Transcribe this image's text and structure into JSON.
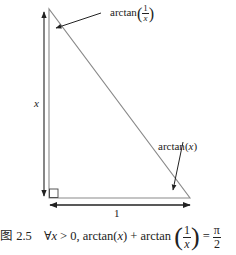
{
  "figure": {
    "type": "right-triangle-diagram",
    "labels": {
      "vertical_side": "x",
      "horizontal_side": "1",
      "top_angle": {
        "func": "arctan",
        "num": "1",
        "den": "x"
      },
      "bottom_right_angle": {
        "func": "arctan",
        "arg": "x"
      }
    },
    "colors": {
      "triangle": "#8a8a8a",
      "arrows": "#222222",
      "background": "#ffffff"
    }
  },
  "caption": {
    "figure_label": "图 2.5",
    "quantifier": "∀",
    "var": "x",
    "condition": "> 0,",
    "lhs_func1": "arctan",
    "lhs_arg1": "x",
    "plus": "+",
    "lhs_func2": "arctan",
    "frac_num": "1",
    "frac_den": "x",
    "equals": "=",
    "rhs_num": "π",
    "rhs_den": "2"
  }
}
